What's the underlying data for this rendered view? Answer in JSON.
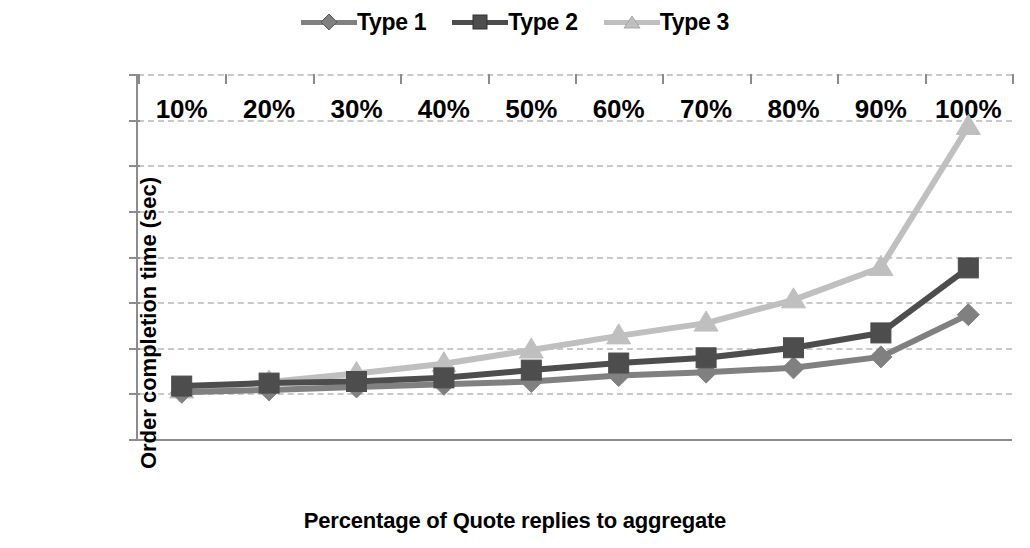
{
  "chart_data": {
    "type": "line",
    "title": "",
    "xlabel": "Percentage of Quote replies to aggregate",
    "ylabel": "Order completion time (sec)",
    "categories": [
      "10%",
      "20%",
      "30%",
      "40%",
      "50%",
      "60%",
      "70%",
      "80%",
      "90%",
      "100%"
    ],
    "ylim": [
      0,
      1600
    ],
    "yticks": [
      "0",
      "200",
      "400",
      "600",
      "800",
      "1000",
      "1200",
      "1400",
      "1600"
    ],
    "ytick_values": [
      0,
      200,
      400,
      600,
      800,
      1000,
      1200,
      1400,
      1600
    ],
    "grid": true,
    "legend_position": "top-center",
    "series": [
      {
        "name": "Type 1",
        "marker": "diamond",
        "color": "#808080",
        "values": [
          205,
          215,
          228,
          240,
          252,
          278,
          293,
          312,
          360,
          545
        ]
      },
      {
        "name": "Type 2",
        "marker": "square",
        "color": "#4d4d4d",
        "values": [
          232,
          245,
          252,
          268,
          302,
          333,
          356,
          400,
          465,
          750
        ]
      },
      {
        "name": "Type 3",
        "marker": "triangle",
        "color": "#bfbfbf",
        "values": [
          215,
          250,
          287,
          330,
          390,
          452,
          508,
          610,
          752,
          1370
        ]
      }
    ]
  },
  "legend": {
    "items": [
      {
        "label": "Type 1"
      },
      {
        "label": "Type 2"
      },
      {
        "label": "Type 3"
      }
    ]
  },
  "axis": {
    "x_title": "Percentage of Quote replies to aggregate",
    "y_title": "Order completion time (sec)"
  }
}
